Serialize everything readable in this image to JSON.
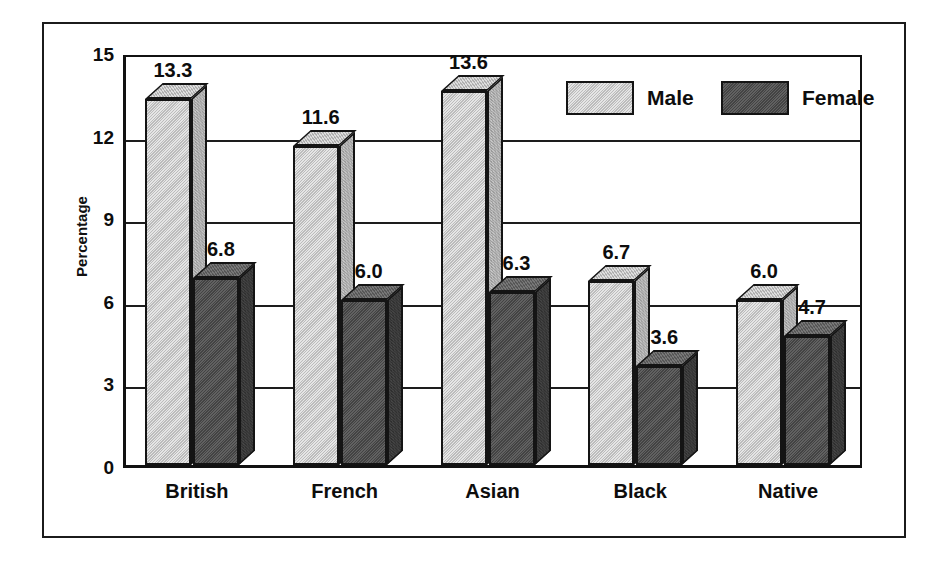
{
  "chart_data": {
    "type": "bar",
    "title": "",
    "xlabel": "",
    "ylabel": "Percentage",
    "ylim": [
      0,
      15
    ],
    "yticks": [
      "0",
      "3",
      "6",
      "9",
      "12",
      "15"
    ],
    "grid": true,
    "legend_position": "top-right",
    "style": "3d-grayscale",
    "categories": [
      "British",
      "French",
      "Asian",
      "Black",
      "Native"
    ],
    "series": [
      {
        "name": "Male",
        "color": "#c6c6c6",
        "values": [
          13.3,
          11.6,
          13.6,
          6.7,
          6.0
        ],
        "labels": [
          "13.3",
          "11.6",
          "13.6",
          "6.7",
          "6.0"
        ]
      },
      {
        "name": "Female",
        "color": "#4b4b4b",
        "values": [
          6.8,
          6.0,
          6.3,
          3.6,
          4.7
        ],
        "labels": [
          "6.8",
          "6.0",
          "6.3",
          "3.6",
          "4.7"
        ]
      }
    ]
  },
  "legend": {
    "entries": [
      {
        "label": "Male"
      },
      {
        "label": "Female"
      }
    ]
  },
  "colors": {
    "male_face": "#c6c6c6",
    "female_face": "#4b4b4b",
    "outline": "#141414",
    "background": "#ffffff"
  }
}
